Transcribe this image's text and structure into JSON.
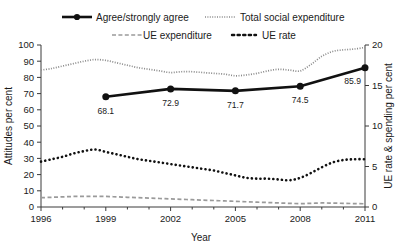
{
  "chart_data": {
    "type": "line",
    "title": "",
    "xlabel": "Year",
    "ylabel": "Attitudes per cent",
    "ylabel_right": "UE rate & spending per cent",
    "xlim": [
      1996,
      2011
    ],
    "ylim": [
      0,
      100
    ],
    "ylim_right": [
      0,
      20
    ],
    "grid": false,
    "legend_position": "top",
    "x_ticks": [
      "1996",
      "1999",
      "2002",
      "2005",
      "2008",
      "2011"
    ],
    "x_tick_values": [
      1996,
      1999,
      2002,
      2005,
      2008,
      2011
    ],
    "y_ticks_left": [
      "0",
      "10",
      "20",
      "30",
      "40",
      "50",
      "60",
      "70",
      "80",
      "90",
      "100"
    ],
    "y_tick_values_left": [
      0,
      10,
      20,
      30,
      40,
      50,
      60,
      70,
      80,
      90,
      100
    ],
    "y_ticks_right": [
      "0",
      "5",
      "10",
      "15",
      "20"
    ],
    "y_tick_values_right": [
      0,
      5,
      10,
      15,
      20
    ],
    "series": [
      {
        "name": "Agree/strongly agree",
        "axis": "left",
        "style": "solid-thick-markers",
        "color": "#111111",
        "x": [
          1999,
          2002,
          2005,
          2008,
          2011
        ],
        "values": [
          68.1,
          72.9,
          71.7,
          74.5,
          85.9
        ],
        "data_labels": [
          "68.1",
          "72.9",
          "71.7",
          "74.5",
          "85.9"
        ]
      },
      {
        "name": "Total social expenditure",
        "axis": "right",
        "style": "dotted-fine",
        "color": "#8a8a8a",
        "x": [
          1996,
          1996.5,
          1997,
          1997.5,
          1998,
          1998.5,
          1999,
          1999.5,
          2000,
          2000.5,
          2001,
          2001.5,
          2002,
          2002.5,
          2003,
          2003.5,
          2004,
          2004.5,
          2005,
          2005.5,
          2006,
          2006.5,
          2007,
          2007.5,
          2008,
          2008.5,
          2009,
          2009.5,
          2010,
          2010.5,
          2011
        ],
        "values": [
          16.9,
          17.1,
          17.4,
          17.7,
          18.0,
          18.2,
          18.1,
          17.8,
          17.5,
          17.2,
          17.0,
          16.8,
          16.6,
          16.7,
          16.7,
          16.6,
          16.5,
          16.4,
          16.2,
          16.3,
          16.5,
          16.8,
          17.0,
          16.9,
          16.8,
          17.6,
          18.6,
          19.2,
          19.4,
          19.5,
          19.7
        ]
      },
      {
        "name": "UE expenditure",
        "axis": "right",
        "style": "dashed",
        "color": "#9a9a9a",
        "x": [
          1996,
          1996.5,
          1997,
          1997.5,
          1998,
          1998.5,
          1999,
          1999.5,
          2000,
          2000.5,
          2001,
          2001.5,
          2002,
          2002.5,
          2003,
          2003.5,
          2004,
          2004.5,
          2005,
          2005.5,
          2006,
          2006.5,
          2007,
          2007.5,
          2008,
          2008.5,
          2009,
          2009.5,
          2010,
          2010.5,
          2011
        ],
        "values": [
          1.15,
          1.2,
          1.25,
          1.3,
          1.3,
          1.32,
          1.3,
          1.25,
          1.2,
          1.15,
          1.1,
          1.05,
          1.0,
          0.95,
          0.9,
          0.85,
          0.8,
          0.75,
          0.7,
          0.65,
          0.6,
          0.55,
          0.5,
          0.45,
          0.42,
          0.45,
          0.5,
          0.48,
          0.45,
          0.42,
          0.4
        ]
      },
      {
        "name": "UE rate",
        "axis": "right",
        "style": "dotted-bold",
        "color": "#111111",
        "x": [
          1996,
          1996.5,
          1997,
          1997.5,
          1998,
          1998.5,
          1999,
          1999.5,
          2000,
          2000.5,
          2001,
          2001.5,
          2002,
          2002.5,
          2003,
          2003.5,
          2004,
          2004.5,
          2005,
          2005.5,
          2006,
          2006.5,
          2007,
          2007.5,
          2008,
          2008.5,
          2009,
          2009.5,
          2010,
          2010.5,
          2011
        ],
        "values": [
          5.6,
          5.9,
          6.2,
          6.6,
          6.9,
          7.1,
          6.8,
          6.5,
          6.2,
          5.9,
          5.7,
          5.5,
          5.3,
          5.1,
          4.9,
          4.7,
          4.5,
          4.2,
          3.9,
          3.6,
          3.5,
          3.5,
          3.4,
          3.3,
          3.6,
          4.2,
          4.9,
          5.5,
          5.8,
          5.9,
          5.9
        ]
      }
    ]
  },
  "legend": {
    "items": [
      {
        "label": "Agree/strongly agree",
        "style": "solid-thick-markers"
      },
      {
        "label": "Total social expenditure",
        "style": "dotted-fine"
      },
      {
        "label": "UE expenditure",
        "style": "dashed"
      },
      {
        "label": "UE rate",
        "style": "dotted-bold"
      }
    ]
  },
  "axes": {
    "left_title": "Attitudes per cent",
    "right_title": "UE rate & spending per cent",
    "x_title": "Year"
  }
}
